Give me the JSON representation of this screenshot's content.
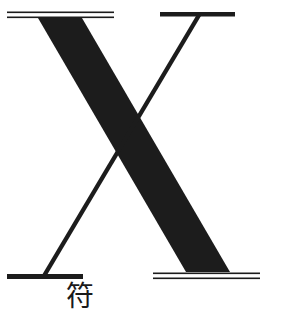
{
  "figure": {
    "letter": "X",
    "ink_color": "#1c1c1c",
    "background": "#ffffff",
    "caption_char": "符"
  }
}
